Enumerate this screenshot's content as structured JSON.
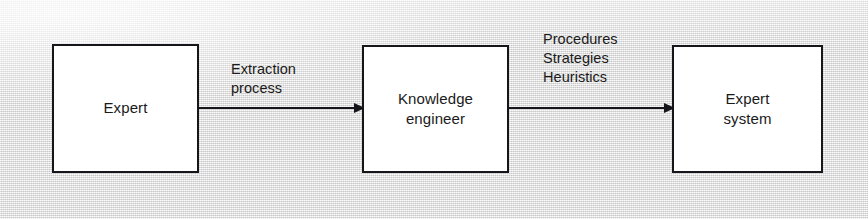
{
  "diagram": {
    "background_color": "#e9e9e9",
    "line_color": "#16161a",
    "box_fill_color": "#ffffff",
    "nodes": [
      {
        "id": "expert",
        "label": "Expert"
      },
      {
        "id": "knowledge_engineer",
        "label": "Knowledge\nengineer"
      },
      {
        "id": "expert_system",
        "label": "Expert\nsystem"
      }
    ],
    "edges": [
      {
        "id": "extraction",
        "from": "expert",
        "to": "knowledge_engineer",
        "label": "Extraction\nprocess",
        "arrowhead": "solid-triangle",
        "direction": "right"
      },
      {
        "id": "transfer",
        "from": "knowledge_engineer",
        "to": "expert_system",
        "label": "Procedures\nStrategies\nHeuristics",
        "arrowhead": "solid-triangle",
        "direction": "right"
      }
    ]
  }
}
